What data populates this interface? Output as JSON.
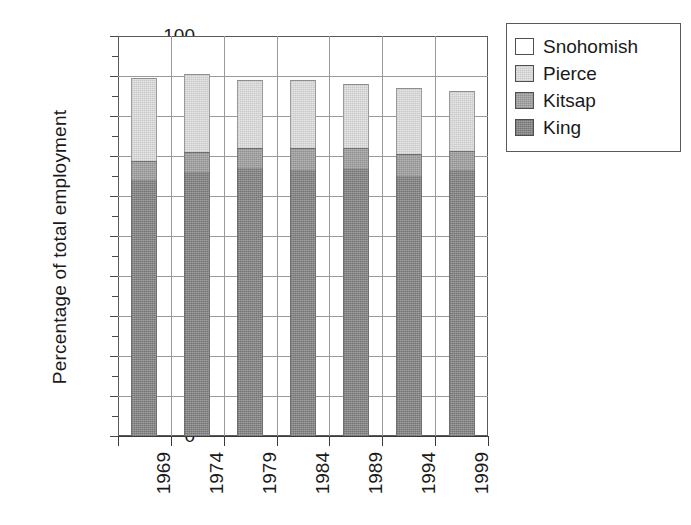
{
  "chart_data": {
    "type": "bar",
    "stacked": true,
    "title": "",
    "xlabel": "",
    "ylabel": "Percentage of total employment",
    "categories": [
      "1969",
      "1974",
      "1979",
      "1984",
      "1989",
      "1994",
      "1999"
    ],
    "ylim": [
      0,
      100
    ],
    "ytick_labels": [
      "0",
      "10",
      "20",
      "30",
      "40",
      "50",
      "60",
      "70",
      "80",
      "90",
      "100"
    ],
    "ytick_values": [
      0,
      10,
      20,
      30,
      40,
      50,
      60,
      70,
      80,
      90,
      100
    ],
    "ytick_step": 10,
    "grid": true,
    "grid_axis": "both",
    "legend_position": "right-top",
    "series": [
      {
        "name": "King",
        "color": "#8c8c8c",
        "values": [
          64.0,
          66.0,
          67.0,
          66.5,
          66.7,
          65.0,
          66.5
        ]
      },
      {
        "name": "Kitsap",
        "color": "#a5a5a5",
        "values": [
          4.8,
          5.0,
          5.0,
          5.5,
          5.3,
          5.5,
          4.8
        ]
      },
      {
        "name": "Pierce",
        "color": "#dedede",
        "values": [
          20.7,
          19.5,
          17.0,
          17.0,
          16.0,
          16.5,
          15.0
        ]
      },
      {
        "name": "Snohomish",
        "color": "#ffffff",
        "values": [
          10.5,
          9.5,
          11.0,
          11.0,
          12.0,
          13.0,
          13.7
        ]
      }
    ],
    "stack_tops": [
      89.5,
      90.5,
      89.0,
      89.0,
      88.0,
      87.0,
      86.3
    ]
  },
  "legend": {
    "items": [
      {
        "label": "Snohomish",
        "swatch": "sw-snohomish"
      },
      {
        "label": "Pierce",
        "swatch": "sw-pierce"
      },
      {
        "label": "Kitsap",
        "swatch": "sw-kitsap"
      },
      {
        "label": "King",
        "swatch": "sw-king"
      }
    ]
  }
}
